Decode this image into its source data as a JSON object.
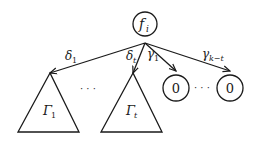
{
  "diagram": {
    "root": {
      "label": "f",
      "subscript": "i"
    },
    "edges": [
      {
        "id": "delta1",
        "label": "δ",
        "subscript": "1"
      },
      {
        "id": "deltat",
        "label": "δ",
        "subscript": "t"
      },
      {
        "id": "gamma1",
        "label": "γ",
        "subscript": "1"
      },
      {
        "id": "gammakt",
        "label": "γ",
        "subscript": "k−t"
      }
    ],
    "subtrees": [
      {
        "label": "Γ",
        "subscript": "1"
      },
      {
        "label": "Γ",
        "subscript": "t"
      }
    ],
    "leaves": [
      {
        "label": "0"
      },
      {
        "label": "0"
      }
    ],
    "ellipsis_subtrees": "· · ·",
    "ellipsis_leaves": "· · ·"
  }
}
